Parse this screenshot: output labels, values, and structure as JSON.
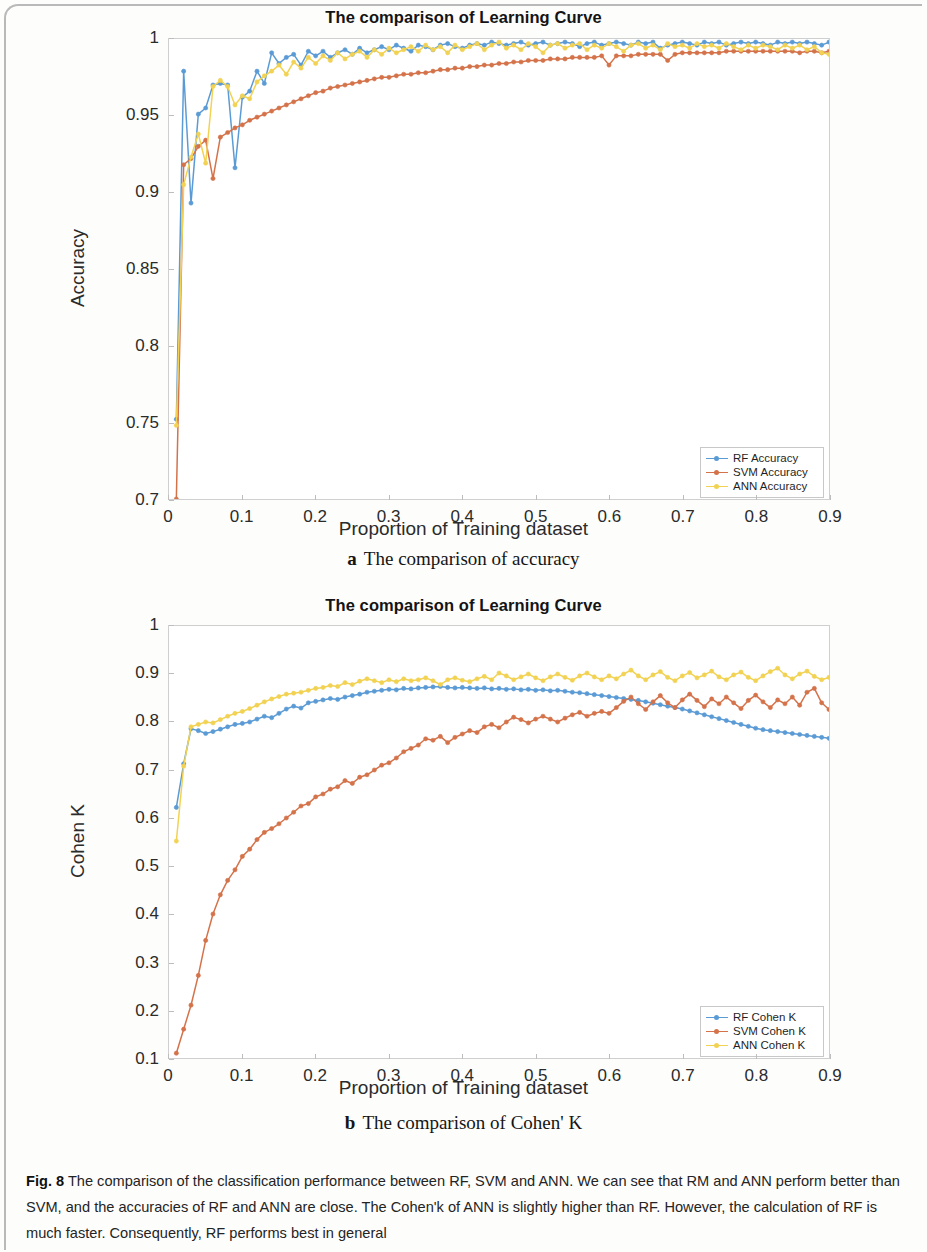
{
  "figure": {
    "label": "Fig. 8",
    "caption": "The comparison of the classification performance between RF, SVM and ANN. We can see that RM and ANN perform better than SVM, and the accuracies of RF and ANN are close. The Cohen'k of ANN is slightly higher than RF. However, the calculation of RF is much faster. Consequently, RF performs best in general",
    "subcaption_a_letter": "a",
    "subcaption_a_text": "The comparison of accuracy",
    "subcaption_b_letter": "b",
    "subcaption_b_text": "The comparison of Cohen' K"
  },
  "colors": {
    "rf": "#5B9BD5",
    "svm": "#D4724A",
    "ann": "#F2D252",
    "axis": "#cfcfcf",
    "text": "#2b2b2b"
  },
  "chart_data": [
    {
      "id": "accuracy",
      "type": "line",
      "title": "The comparison of Learning Curve",
      "xlabel": "Proportion of Training dataset",
      "ylabel": "Accuracy",
      "xlim": [
        0,
        0.9
      ],
      "ylim": [
        0.7,
        1.0
      ],
      "xticks": [
        "0",
        "0.1",
        "0.2",
        "0.3",
        "0.4",
        "0.5",
        "0.6",
        "0.7",
        "0.8",
        "0.9"
      ],
      "xtick_values": [
        0,
        0.1,
        0.2,
        0.3,
        0.4,
        0.5,
        0.6,
        0.7,
        0.8,
        0.9
      ],
      "yticks": [
        "0.7",
        "0.75",
        "0.8",
        "0.85",
        "0.9",
        "0.95",
        "1"
      ],
      "ytick_values": [
        0.7,
        0.75,
        0.8,
        0.85,
        0.9,
        0.95,
        1.0
      ],
      "grid": false,
      "legend_position": "bottom-right",
      "x": [
        0.01,
        0.02,
        0.03,
        0.04,
        0.05,
        0.06,
        0.07,
        0.08,
        0.09,
        0.1,
        0.11,
        0.12,
        0.13,
        0.14,
        0.15,
        0.16,
        0.17,
        0.18,
        0.19,
        0.2,
        0.21,
        0.22,
        0.23,
        0.24,
        0.25,
        0.26,
        0.27,
        0.28,
        0.29,
        0.3,
        0.31,
        0.32,
        0.33,
        0.34,
        0.35,
        0.36,
        0.37,
        0.38,
        0.39,
        0.4,
        0.41,
        0.42,
        0.43,
        0.44,
        0.45,
        0.46,
        0.47,
        0.48,
        0.49,
        0.5,
        0.51,
        0.52,
        0.53,
        0.54,
        0.55,
        0.56,
        0.57,
        0.58,
        0.59,
        0.6,
        0.61,
        0.62,
        0.63,
        0.64,
        0.65,
        0.66,
        0.67,
        0.68,
        0.69,
        0.7,
        0.71,
        0.72,
        0.73,
        0.74,
        0.75,
        0.76,
        0.77,
        0.78,
        0.79,
        0.8,
        0.81,
        0.82,
        0.83,
        0.84,
        0.85,
        0.86,
        0.87,
        0.88,
        0.89,
        0.9
      ],
      "series": [
        {
          "name": "RF Accuracy",
          "color": "#5B9BD5",
          "values": [
            0.752,
            0.979,
            0.893,
            0.951,
            0.955,
            0.97,
            0.971,
            0.97,
            0.916,
            0.962,
            0.966,
            0.979,
            0.971,
            0.991,
            0.984,
            0.988,
            0.99,
            0.983,
            0.992,
            0.989,
            0.992,
            0.988,
            0.991,
            0.993,
            0.99,
            0.994,
            0.991,
            0.993,
            0.995,
            0.993,
            0.996,
            0.994,
            0.992,
            0.996,
            0.995,
            0.993,
            0.996,
            0.997,
            0.995,
            0.994,
            0.996,
            0.997,
            0.996,
            0.998,
            0.997,
            0.996,
            0.997,
            0.998,
            0.996,
            0.997,
            0.998,
            0.996,
            0.997,
            0.998,
            0.997,
            0.995,
            0.997,
            0.998,
            0.996,
            0.997,
            0.998,
            0.997,
            0.996,
            0.998,
            0.997,
            0.998,
            0.994,
            0.996,
            0.997,
            0.998,
            0.997,
            0.996,
            0.998,
            0.997,
            0.998,
            0.996,
            0.997,
            0.998,
            0.997,
            0.998,
            0.997,
            0.996,
            0.998,
            0.997,
            0.998,
            0.997,
            0.998,
            0.997,
            0.996,
            0.998
          ]
        },
        {
          "name": "SVM Accuracy",
          "color": "#D4724A",
          "values": [
            0.7,
            0.918,
            0.922,
            0.93,
            0.934,
            0.909,
            0.936,
            0.939,
            0.942,
            0.944,
            0.947,
            0.949,
            0.951,
            0.953,
            0.955,
            0.957,
            0.959,
            0.961,
            0.963,
            0.965,
            0.966,
            0.968,
            0.969,
            0.97,
            0.971,
            0.972,
            0.973,
            0.974,
            0.975,
            0.975,
            0.976,
            0.977,
            0.977,
            0.978,
            0.978,
            0.979,
            0.98,
            0.98,
            0.981,
            0.981,
            0.982,
            0.982,
            0.983,
            0.983,
            0.984,
            0.984,
            0.985,
            0.985,
            0.986,
            0.986,
            0.986,
            0.987,
            0.987,
            0.987,
            0.988,
            0.988,
            0.988,
            0.988,
            0.989,
            0.983,
            0.989,
            0.989,
            0.989,
            0.99,
            0.99,
            0.99,
            0.99,
            0.986,
            0.99,
            0.991,
            0.991,
            0.991,
            0.991,
            0.991,
            0.991,
            0.992,
            0.992,
            0.992,
            0.992,
            0.992,
            0.992,
            0.992,
            0.992,
            0.992,
            0.992,
            0.991,
            0.992,
            0.992,
            0.991,
            0.992
          ]
        },
        {
          "name": "ANN Accuracy",
          "color": "#F2D252",
          "values": [
            0.748,
            0.905,
            0.923,
            0.938,
            0.919,
            0.969,
            0.973,
            0.969,
            0.957,
            0.963,
            0.961,
            0.972,
            0.976,
            0.979,
            0.983,
            0.977,
            0.985,
            0.981,
            0.988,
            0.984,
            0.989,
            0.986,
            0.991,
            0.987,
            0.99,
            0.992,
            0.988,
            0.993,
            0.99,
            0.994,
            0.991,
            0.993,
            0.995,
            0.992,
            0.996,
            0.993,
            0.995,
            0.991,
            0.996,
            0.993,
            0.995,
            0.997,
            0.993,
            0.996,
            0.998,
            0.994,
            0.996,
            0.993,
            0.997,
            0.995,
            0.991,
            0.996,
            0.997,
            0.994,
            0.996,
            0.997,
            0.993,
            0.996,
            0.994,
            0.997,
            0.995,
            0.992,
            0.996,
            0.997,
            0.994,
            0.996,
            0.993,
            0.997,
            0.995,
            0.996,
            0.994,
            0.997,
            0.995,
            0.996,
            0.994,
            0.997,
            0.995,
            0.993,
            0.996,
            0.994,
            0.996,
            0.995,
            0.993,
            0.996,
            0.994,
            0.996,
            0.993,
            0.995,
            0.991,
            0.99
          ]
        }
      ]
    },
    {
      "id": "cohen-k",
      "type": "line",
      "title": "The comparison of Learning Curve",
      "xlabel": "Proportion of Training dataset",
      "ylabel": "Cohen K",
      "xlim": [
        0,
        0.9
      ],
      "ylim": [
        0.1,
        1.0
      ],
      "xticks": [
        "0",
        "0.1",
        "0.2",
        "0.3",
        "0.4",
        "0.5",
        "0.6",
        "0.7",
        "0.8",
        "0.9"
      ],
      "xtick_values": [
        0,
        0.1,
        0.2,
        0.3,
        0.4,
        0.5,
        0.6,
        0.7,
        0.8,
        0.9
      ],
      "yticks": [
        "0.1",
        "0.2",
        "0.3",
        "0.4",
        "0.5",
        "0.6",
        "0.7",
        "0.8",
        "0.9",
        "1"
      ],
      "ytick_values": [
        0.1,
        0.2,
        0.3,
        0.4,
        0.5,
        0.6,
        0.7,
        0.8,
        0.9,
        1.0
      ],
      "grid": false,
      "legend_position": "bottom-right",
      "x": [
        0.01,
        0.02,
        0.03,
        0.04,
        0.05,
        0.06,
        0.07,
        0.08,
        0.09,
        0.1,
        0.11,
        0.12,
        0.13,
        0.14,
        0.15,
        0.16,
        0.17,
        0.18,
        0.19,
        0.2,
        0.21,
        0.22,
        0.23,
        0.24,
        0.25,
        0.26,
        0.27,
        0.28,
        0.29,
        0.3,
        0.31,
        0.32,
        0.33,
        0.34,
        0.35,
        0.36,
        0.37,
        0.38,
        0.39,
        0.4,
        0.41,
        0.42,
        0.43,
        0.44,
        0.45,
        0.46,
        0.47,
        0.48,
        0.49,
        0.5,
        0.51,
        0.52,
        0.53,
        0.54,
        0.55,
        0.56,
        0.57,
        0.58,
        0.59,
        0.6,
        0.61,
        0.62,
        0.63,
        0.64,
        0.65,
        0.66,
        0.67,
        0.68,
        0.69,
        0.7,
        0.71,
        0.72,
        0.73,
        0.74,
        0.75,
        0.76,
        0.77,
        0.78,
        0.79,
        0.8,
        0.81,
        0.82,
        0.83,
        0.84,
        0.85,
        0.86,
        0.87,
        0.88,
        0.89,
        0.9
      ],
      "series": [
        {
          "name": "RF Cohen K",
          "color": "#5B9BD5",
          "values": [
            0.622,
            0.713,
            0.786,
            0.782,
            0.776,
            0.78,
            0.785,
            0.79,
            0.795,
            0.797,
            0.8,
            0.806,
            0.812,
            0.809,
            0.818,
            0.827,
            0.833,
            0.829,
            0.84,
            0.843,
            0.846,
            0.849,
            0.847,
            0.852,
            0.855,
            0.858,
            0.862,
            0.864,
            0.866,
            0.868,
            0.867,
            0.87,
            0.869,
            0.871,
            0.872,
            0.873,
            0.874,
            0.872,
            0.871,
            0.872,
            0.871,
            0.87,
            0.871,
            0.869,
            0.87,
            0.868,
            0.869,
            0.867,
            0.868,
            0.866,
            0.867,
            0.865,
            0.866,
            0.864,
            0.862,
            0.861,
            0.859,
            0.857,
            0.855,
            0.853,
            0.851,
            0.849,
            0.847,
            0.845,
            0.842,
            0.839,
            0.836,
            0.833,
            0.83,
            0.827,
            0.823,
            0.819,
            0.815,
            0.811,
            0.807,
            0.803,
            0.799,
            0.795,
            0.791,
            0.787,
            0.784,
            0.782,
            0.78,
            0.778,
            0.776,
            0.774,
            0.772,
            0.77,
            0.768,
            0.766
          ]
        },
        {
          "name": "SVM Cohen K",
          "color": "#D4724A",
          "values": [
            0.11,
            0.16,
            0.21,
            0.272,
            0.345,
            0.4,
            0.44,
            0.47,
            0.492,
            0.52,
            0.535,
            0.555,
            0.57,
            0.578,
            0.588,
            0.6,
            0.612,
            0.625,
            0.63,
            0.644,
            0.65,
            0.66,
            0.665,
            0.678,
            0.672,
            0.685,
            0.69,
            0.7,
            0.71,
            0.715,
            0.725,
            0.738,
            0.745,
            0.752,
            0.765,
            0.762,
            0.77,
            0.757,
            0.768,
            0.775,
            0.782,
            0.778,
            0.79,
            0.795,
            0.788,
            0.8,
            0.81,
            0.805,
            0.798,
            0.806,
            0.812,
            0.806,
            0.8,
            0.808,
            0.815,
            0.82,
            0.812,
            0.818,
            0.822,
            0.818,
            0.83,
            0.843,
            0.852,
            0.838,
            0.826,
            0.842,
            0.855,
            0.84,
            0.83,
            0.846,
            0.858,
            0.845,
            0.832,
            0.848,
            0.838,
            0.852,
            0.84,
            0.828,
            0.845,
            0.856,
            0.842,
            0.83,
            0.846,
            0.838,
            0.852,
            0.835,
            0.862,
            0.87,
            0.84,
            0.826
          ]
        },
        {
          "name": "ANN Cohen K",
          "color": "#F2D252",
          "values": [
            0.552,
            0.708,
            0.79,
            0.795,
            0.8,
            0.798,
            0.805,
            0.812,
            0.818,
            0.822,
            0.828,
            0.835,
            0.842,
            0.848,
            0.853,
            0.858,
            0.86,
            0.862,
            0.866,
            0.87,
            0.872,
            0.876,
            0.874,
            0.882,
            0.878,
            0.885,
            0.89,
            0.886,
            0.882,
            0.888,
            0.884,
            0.89,
            0.886,
            0.888,
            0.892,
            0.886,
            0.878,
            0.888,
            0.892,
            0.887,
            0.884,
            0.89,
            0.895,
            0.888,
            0.902,
            0.896,
            0.888,
            0.894,
            0.9,
            0.892,
            0.886,
            0.894,
            0.9,
            0.893,
            0.887,
            0.896,
            0.902,
            0.894,
            0.888,
            0.896,
            0.89,
            0.9,
            0.908,
            0.896,
            0.888,
            0.898,
            0.905,
            0.893,
            0.886,
            0.896,
            0.903,
            0.892,
            0.898,
            0.906,
            0.894,
            0.888,
            0.898,
            0.904,
            0.893,
            0.886,
            0.896,
            0.905,
            0.912,
            0.898,
            0.89,
            0.9,
            0.906,
            0.895,
            0.888,
            0.893
          ]
        }
      ]
    }
  ]
}
